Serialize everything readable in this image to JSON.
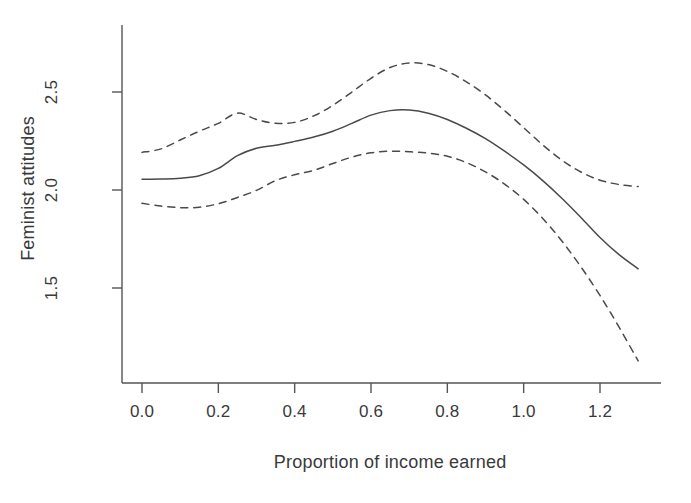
{
  "chart_data": {
    "type": "line",
    "title": "",
    "xlabel": "Proportion of income earned",
    "ylabel": "Feminist attitudes",
    "xlim": [
      -0.055,
      1.41
    ],
    "ylim": [
      1.07,
      2.72
    ],
    "xticks": [
      0.0,
      0.2,
      0.4,
      0.6,
      0.8,
      1.0,
      1.2
    ],
    "xticklabels": [
      "0.0",
      "0.2",
      "0.4",
      "0.6",
      "0.8",
      "1.0",
      "1.2"
    ],
    "yticks": [
      1.5,
      2.0,
      2.5
    ],
    "yticklabels": [
      "1.5",
      "2.0",
      "2.5"
    ],
    "grid": false,
    "legend": "none",
    "line_color": "#4a4a4a",
    "series": [
      {
        "name": "fitted smooth",
        "style": "solid",
        "x": [
          0.0,
          0.05,
          0.1,
          0.15,
          0.2,
          0.25,
          0.3,
          0.35,
          0.4,
          0.45,
          0.5,
          0.55,
          0.6,
          0.65,
          0.7,
          0.75,
          0.8,
          0.85,
          0.9,
          0.95,
          1.0,
          1.05,
          1.1,
          1.15,
          1.2,
          1.25,
          1.3
        ],
        "y": [
          2.055,
          2.056,
          2.06,
          2.073,
          2.11,
          2.175,
          2.213,
          2.228,
          2.248,
          2.27,
          2.3,
          2.34,
          2.382,
          2.405,
          2.408,
          2.392,
          2.36,
          2.315,
          2.262,
          2.198,
          2.128,
          2.048,
          1.958,
          1.86,
          1.758,
          1.67,
          1.598
        ]
      },
      {
        "name": "upper confidence band",
        "style": "dashed",
        "x": [
          0.0,
          0.05,
          0.1,
          0.15,
          0.2,
          0.25,
          0.3,
          0.35,
          0.4,
          0.45,
          0.5,
          0.55,
          0.6,
          0.65,
          0.7,
          0.75,
          0.8,
          0.85,
          0.9,
          0.95,
          1.0,
          1.05,
          1.1,
          1.15,
          1.2,
          1.25,
          1.3
        ],
        "y": [
          2.192,
          2.21,
          2.255,
          2.3,
          2.34,
          2.392,
          2.36,
          2.34,
          2.345,
          2.378,
          2.432,
          2.5,
          2.57,
          2.625,
          2.648,
          2.64,
          2.605,
          2.552,
          2.485,
          2.405,
          2.318,
          2.23,
          2.152,
          2.092,
          2.05,
          2.028,
          2.018
        ]
      },
      {
        "name": "lower confidence band",
        "style": "dashed",
        "x": [
          0.0,
          0.05,
          0.1,
          0.15,
          0.2,
          0.25,
          0.3,
          0.35,
          0.4,
          0.45,
          0.5,
          0.55,
          0.6,
          0.65,
          0.7,
          0.75,
          0.8,
          0.85,
          0.9,
          0.95,
          1.0,
          1.05,
          1.1,
          1.15,
          1.2,
          1.25,
          1.3
        ],
        "y": [
          1.932,
          1.918,
          1.91,
          1.912,
          1.93,
          1.962,
          1.998,
          2.048,
          2.078,
          2.1,
          2.135,
          2.168,
          2.19,
          2.198,
          2.195,
          2.188,
          2.172,
          2.14,
          2.092,
          2.03,
          1.952,
          1.855,
          1.74,
          1.608,
          1.462,
          1.3,
          1.128
        ]
      }
    ]
  },
  "axes": {
    "y_axis_name": "vertical-axis-line",
    "x_axis_name": "horizontal-axis-line"
  }
}
